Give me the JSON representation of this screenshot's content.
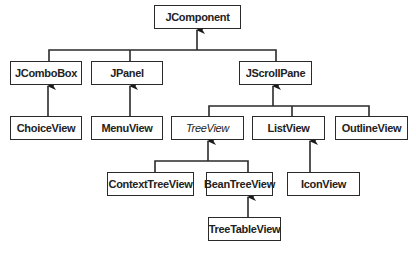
{
  "diagram": {
    "type": "class-hierarchy",
    "colors": {
      "line": "#2a2a2a",
      "box_border": "#2a2a2a",
      "text": "#222222",
      "background": "#ffffff"
    },
    "nodes": {
      "jcomponent": {
        "label": "JComponent",
        "x": 154,
        "y": 5,
        "w": 87,
        "h": 24
      },
      "jcombobox": {
        "label": "JComboBox",
        "x": 10,
        "y": 61,
        "w": 72,
        "h": 24
      },
      "jpanel": {
        "label": "JPanel",
        "x": 91,
        "y": 61,
        "w": 72,
        "h": 24
      },
      "jscrollpane": {
        "label": "JScrollPane",
        "x": 239,
        "y": 61,
        "w": 73,
        "h": 24
      },
      "choiceview": {
        "label": "ChoiceView",
        "x": 10,
        "y": 116,
        "w": 72,
        "h": 24
      },
      "menuview": {
        "label": "MenuView",
        "x": 91,
        "y": 116,
        "w": 72,
        "h": 24
      },
      "treeview": {
        "label": "TreeView",
        "x": 171,
        "y": 116,
        "w": 73,
        "h": 24,
        "italic": true
      },
      "listview": {
        "label": "ListView",
        "x": 252,
        "y": 116,
        "w": 73,
        "h": 24
      },
      "outlineview": {
        "label": "OutlineView",
        "x": 335,
        "y": 116,
        "w": 73,
        "h": 24
      },
      "contexttreeview": {
        "label": "ContextTreeView",
        "x": 107,
        "y": 172,
        "w": 87,
        "h": 24
      },
      "beantreeview": {
        "label": "BeanTreeView",
        "x": 206,
        "y": 172,
        "w": 67,
        "h": 24
      },
      "iconview": {
        "label": "IconView",
        "x": 287,
        "y": 172,
        "w": 73,
        "h": 24
      },
      "treetableview": {
        "label": "TreeTableView",
        "x": 208,
        "y": 217,
        "w": 73,
        "h": 24
      }
    },
    "edges": [
      {
        "from": "JComboBox",
        "to": "JComponent"
      },
      {
        "from": "JPanel",
        "to": "JComponent"
      },
      {
        "from": "JScrollPane",
        "to": "JComponent"
      },
      {
        "from": "ChoiceView",
        "to": "JComboBox"
      },
      {
        "from": "MenuView",
        "to": "JPanel"
      },
      {
        "from": "TreeView",
        "to": "JScrollPane"
      },
      {
        "from": "ListView",
        "to": "JScrollPane"
      },
      {
        "from": "OutlineView",
        "to": "JScrollPane"
      },
      {
        "from": "ContextTreeView",
        "to": "TreeView"
      },
      {
        "from": "BeanTreeView",
        "to": "TreeView"
      },
      {
        "from": "IconView",
        "to": "ListView"
      },
      {
        "from": "TreeTableView",
        "to": "BeanTreeView"
      }
    ]
  }
}
